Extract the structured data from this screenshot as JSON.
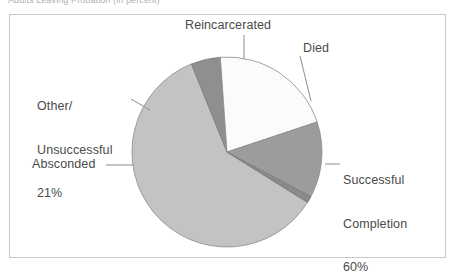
{
  "figure": {
    "title_clipped": "Adults Leaving Probation (in percent)",
    "frame_color": "#c8c8c8",
    "background": "#ffffff"
  },
  "chart_data": {
    "type": "pie",
    "title": "Adults Leaving Probation (in percent)",
    "xlabel": "",
    "ylabel": "",
    "grid": false,
    "legend": "none",
    "labels_position": "outside-with-leader-lines",
    "categories": [
      "Successful Completion",
      "Other/Unsuccessful",
      "Reincarcerated",
      "Absconded",
      "Died"
    ],
    "values": [
      60,
      21,
      14,
      4,
      1
    ],
    "unit": "percent",
    "slices": [
      {
        "name": "Successful Completion",
        "label": "Successful\nCompletion\n60%",
        "value": 60,
        "value_text": "60%",
        "color": "#c3c3c3",
        "start_angle_deg": 32,
        "sweep_deg": 216
      },
      {
        "name": "Other/Unsuccessful",
        "label": "Other/\nUnsuccessful\n21%",
        "value": 21,
        "value_text": "21%",
        "color": "#fbfbfb",
        "start_angle_deg": 266,
        "sweep_deg": 75.6
      },
      {
        "name": "Reincarcerated",
        "label": "Reincarcerated",
        "value": 14,
        "value_text": "",
        "color": "#9c9c9c",
        "start_angle_deg": 341.6,
        "sweep_deg": 50.4
      },
      {
        "name": "Absconded",
        "label": "Absconded",
        "value": 4,
        "value_text": "",
        "color": "#8f8f8f",
        "start_angle_deg": 248,
        "sweep_deg": 18
      },
      {
        "name": "Died",
        "label": "Died",
        "value": 1,
        "value_text": "",
        "color": "#8a8a8a",
        "start_angle_deg": 28,
        "sweep_deg": 4
      }
    ],
    "geometry": {
      "center_x": 227,
      "center_y": 152,
      "radius": 95
    }
  },
  "labels": {
    "reincarcerated": "Reincarcerated",
    "died": "Died",
    "other_line1": "Other/",
    "other_line2": "Unsuccessful",
    "other_line3": "21%",
    "absconded": "Absconded",
    "successful_line1": "Successful",
    "successful_line2": "Completion",
    "successful_line3": "60%"
  }
}
